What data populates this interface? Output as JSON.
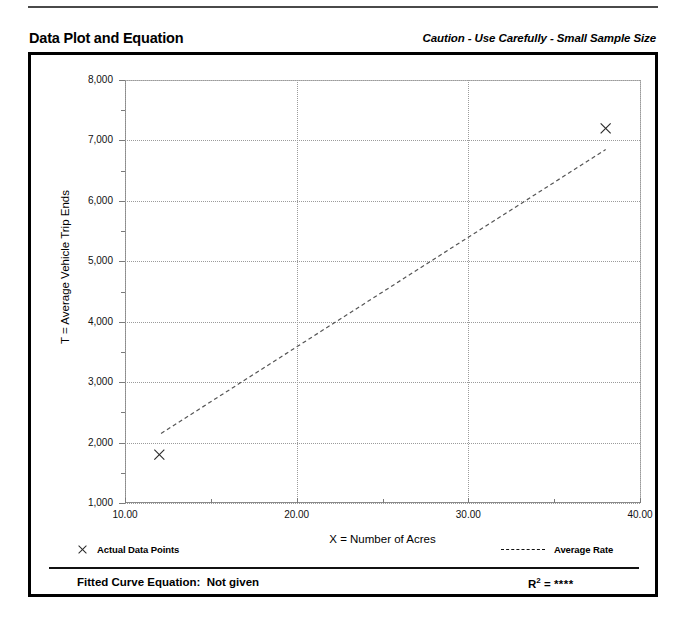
{
  "header": {
    "title": "Data Plot and Equation",
    "caution": "Caution - Use Carefully - Small Sample Size"
  },
  "legend": {
    "data_points_label": "Actual Data Points",
    "average_rate_label": "Average Rate",
    "marker_icon": "x-marker-icon",
    "line_icon": "dashed-line-icon"
  },
  "footer": {
    "equation_label": "Fitted Curve Equation:",
    "equation_value": "Not given",
    "r2_label": "R",
    "r2_exponent": "2",
    "r2_equals": " = ",
    "r2_value": "****"
  },
  "colors": {
    "frame": "#000000",
    "gridline": "#9b9b9b",
    "axis": "#8a8a8a",
    "marker": "#2a2a2a",
    "trendline": "#555555",
    "text": "#000000"
  },
  "chart_data": {
    "type": "scatter",
    "title": "Data Plot and Equation",
    "xlabel": "X = Number of Acres",
    "ylabel": "T = Average Vehicle Trip Ends",
    "xlim": [
      10,
      40
    ],
    "ylim": [
      1000,
      8000
    ],
    "grid": true,
    "legend_position": "below-plot",
    "x_ticks": [
      10,
      15,
      20,
      25,
      30,
      35,
      40
    ],
    "x_major_ticks": [
      10,
      20,
      30,
      40
    ],
    "x_tick_labels": [
      "10.00",
      "20.00",
      "30.00",
      "40.00"
    ],
    "y_ticks": [
      1000,
      1500,
      2000,
      2500,
      3000,
      3500,
      4000,
      4500,
      5000,
      5500,
      6000,
      6500,
      7000,
      7500,
      8000
    ],
    "y_major_ticks": [
      1000,
      2000,
      3000,
      4000,
      5000,
      6000,
      7000,
      8000
    ],
    "y_tick_labels": [
      "1,000",
      "2,000",
      "3,000",
      "4,000",
      "5,000",
      "6,000",
      "7,000",
      "8,000"
    ],
    "series": [
      {
        "name": "Actual Data Points",
        "type": "scatter",
        "marker": "x",
        "points": [
          {
            "x": 12,
            "y": 1800
          },
          {
            "x": 38,
            "y": 7200
          }
        ]
      },
      {
        "name": "Average Rate",
        "type": "line",
        "style": "dashed",
        "points": [
          {
            "x": 12.1,
            "y": 2150
          },
          {
            "x": 38.0,
            "y": 6850
          }
        ]
      }
    ],
    "fitted_curve_equation": "Not given",
    "r_squared": "****",
    "annotation": "Caution - Use Carefully - Small Sample Size"
  }
}
